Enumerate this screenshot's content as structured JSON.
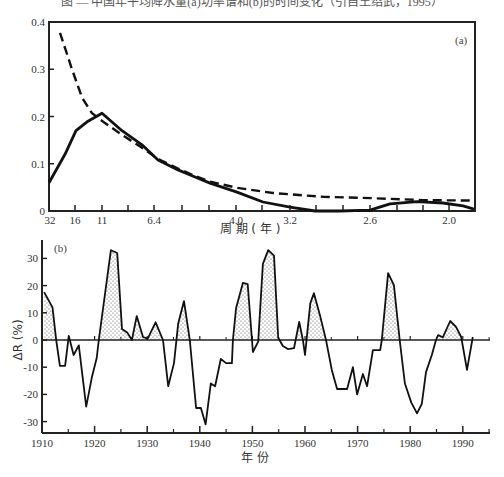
{
  "caption": "图 — 中国年平均降水量(a)功率谱和(b)的时间变化（引自王绍武，1995）",
  "chart_data": [
    {
      "panel": "a",
      "type": "line",
      "panel_label": "(a)",
      "xlabel": "周 期 ( 年 )",
      "ylabel": "",
      "ylim": [
        0,
        0.4
      ],
      "yticks": [
        0,
        0.1,
        0.2,
        0.3,
        0.4
      ],
      "ytick_labels": [
        "0",
        "0.1",
        "0.2",
        "0.3",
        "0.4"
      ],
      "xtick_labels": [
        "32",
        "16",
        "11",
        "6.4",
        "4.0",
        "3.2",
        "2.6",
        "2.0"
      ],
      "xtick_positions_px": [
        50,
        75,
        102,
        154,
        236,
        290,
        370,
        449
      ],
      "minor_tick_positions_px": [
        75,
        102,
        128,
        154,
        182,
        209,
        236,
        262,
        290,
        316,
        343,
        370,
        397,
        423,
        449
      ],
      "grid": false,
      "series": [
        {
          "name": "spectrum",
          "style": "solid",
          "points_px_x": [
            49,
            65,
            76,
            88,
            102,
            122,
            142,
            158,
            178,
            195,
            210,
            237,
            263,
            290,
            315,
            340,
            370,
            390,
            417,
            443,
            463,
            474
          ],
          "values": [
            0.06,
            0.12,
            0.17,
            0.19,
            0.207,
            0.17,
            0.14,
            0.108,
            0.087,
            0.072,
            0.059,
            0.04,
            0.019,
            0.008,
            0.0,
            0.0,
            0.002,
            0.015,
            0.02,
            0.017,
            0.011,
            0.004
          ]
        },
        {
          "name": "red-noise reference",
          "style": "dashed",
          "points_px_x": [
            60,
            72,
            82,
            92,
            105,
            125,
            142,
            158,
            178,
            195,
            210,
            237,
            273,
            323,
            373,
            423,
            474
          ],
          "values": [
            0.377,
            0.3,
            0.24,
            0.207,
            0.186,
            0.157,
            0.134,
            0.11,
            0.09,
            0.074,
            0.062,
            0.049,
            0.038,
            0.03,
            0.027,
            0.023,
            0.022
          ]
        }
      ]
    },
    {
      "panel": "b",
      "type": "area",
      "panel_label": "(b)",
      "xlabel": "年    份",
      "ylabel": "ΔR (%)",
      "xlim": [
        1910,
        1995
      ],
      "ylim": [
        -34,
        38
      ],
      "yticks": [
        -30,
        -20,
        -10,
        0,
        10,
        20,
        30
      ],
      "ytick_labels": [
        "-30",
        "-20",
        "-10",
        "0",
        "10",
        "20",
        "30"
      ],
      "xticks": [
        1910,
        1920,
        1930,
        1940,
        1950,
        1960,
        1970,
        1980,
        1990
      ],
      "xtick_labels": [
        "1910",
        "1920",
        "1930",
        "1940",
        "1950",
        "1960",
        "1970",
        "1980",
        "1990"
      ],
      "minor_xticks": [
        1915,
        1925,
        1935,
        1945,
        1955,
        1965,
        1975,
        1985,
        1995
      ],
      "positive_fill": "dotted",
      "grid": false,
      "x": [
        1910.4,
        1912.0,
        1912.7,
        1913.4,
        1914.4,
        1915.1,
        1916.0,
        1917.0,
        1918.4,
        1919.5,
        1920.4,
        1920.8,
        1923.1,
        1924.3,
        1925.2,
        1926.2,
        1927.1,
        1928.0,
        1929.2,
        1930.1,
        1931.6,
        1933.0,
        1934.0,
        1935.1,
        1935.9,
        1937.0,
        1938.1,
        1939.3,
        1940.2,
        1941.1,
        1942.1,
        1942.9,
        1944.0,
        1945.0,
        1946.1,
        1946.3,
        1946.9,
        1948.2,
        1949.1,
        1950.1,
        1951.1,
        1952.0,
        1953.0,
        1954.1,
        1954.9,
        1955.8,
        1956.8,
        1957.9,
        1958.9,
        1959.6,
        1960.0,
        1961.0,
        1961.7,
        1962.9,
        1964.0,
        1965.1,
        1966.1,
        1968.0,
        1969.1,
        1969.9,
        1971.0,
        1971.8,
        1972.9,
        1974.3,
        1974.6,
        1975.8,
        1976.9,
        1978.0,
        1979.0,
        1980.2,
        1981.3,
        1982.2,
        1983.0,
        1984.1,
        1984.9,
        1985.3,
        1986.2,
        1987.6,
        1988.7,
        1989.7,
        1990.8,
        1991.9
      ],
      "values": [
        17.6,
        12.0,
        0.0,
        -9.5,
        -9.5,
        1.5,
        -5.5,
        -2.0,
        -24.5,
        -13.5,
        -6.6,
        0.0,
        33.0,
        32.0,
        4.0,
        2.8,
        0.0,
        8.8,
        1.1,
        0.5,
        6.5,
        0.0,
        -17.0,
        -8.5,
        6.1,
        14.3,
        0.0,
        -25.0,
        -25.0,
        -31.0,
        -16.0,
        -17.0,
        -7.0,
        -8.5,
        -8.5,
        0.0,
        11.8,
        21.0,
        20.5,
        -4.4,
        -0.6,
        28.0,
        33.0,
        31.0,
        0.8,
        -2.2,
        -3.4,
        -3.0,
        6.6,
        0.0,
        -5.5,
        13.5,
        17.2,
        8.6,
        0.0,
        -11.0,
        -18.0,
        -18.0,
        -10.0,
        -20.0,
        -12.5,
        -17.0,
        -3.7,
        -3.7,
        0.0,
        24.6,
        20.2,
        0.0,
        -16.0,
        -23.0,
        -27.0,
        -23.5,
        -11.8,
        -5.5,
        0.0,
        1.8,
        1.0,
        7.0,
        4.8,
        1.1,
        -11.0,
        1.1
      ]
    }
  ],
  "layout": {
    "a": {
      "left": 49,
      "right": 475,
      "top": 22,
      "bottom": 211
    },
    "b": {
      "left": 42,
      "right": 490,
      "zero_y": 340,
      "px_per_unit_y": 2.72,
      "x0_year": 1910,
      "px_per_year": 5.26,
      "axis_bottom": 433,
      "axis_top": 240
    },
    "colors": {
      "line": "#111111",
      "axis": "#222222",
      "dot": "#555555",
      "background": "#ffffff"
    }
  }
}
